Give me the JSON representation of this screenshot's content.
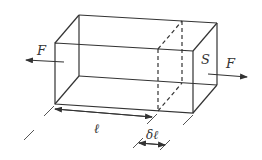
{
  "diagram": {
    "labels": {
      "force_left": "F",
      "force_right": "F",
      "cross_section": "S",
      "length": "ℓ",
      "elongation": "δℓ"
    },
    "colors": {
      "stroke": "#333333",
      "background": "#ffffff"
    }
  }
}
